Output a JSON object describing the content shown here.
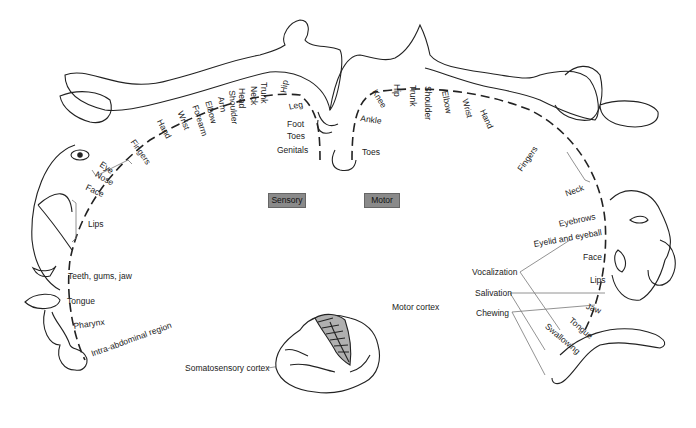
{
  "diagram": {
    "title_labels": {
      "sensory": "Sensory",
      "motor": "Motor"
    },
    "sensory_labels": [
      "Genitals",
      "Toes",
      "Foot",
      "Leg",
      "Hip",
      "Trunk",
      "Neck",
      "Head",
      "Shoulder",
      "Arm",
      "Elbow",
      "Forearm",
      "Wrist",
      "Hand",
      "Fingers",
      "Eye",
      "Nose",
      "Face",
      "Lips",
      "Teeth, gums, jaw",
      "Tongue",
      "Pharynx",
      "Intra-abdominal region"
    ],
    "motor_labels": [
      "Toes",
      "Ankle",
      "Knee",
      "Hip",
      "Trunk",
      "Shoulder",
      "Elbow",
      "Wrist",
      "Hand",
      "Fingers",
      "Neck",
      "Eyebrows",
      "Eyelid and eyeball",
      "Face",
      "Lips",
      "Jaw",
      "Tongue",
      "Swallowing"
    ],
    "function_labels": [
      "Vocalization",
      "Salivation",
      "Chewing"
    ],
    "brain_labels": {
      "motor_cortex": "Motor cortex",
      "somatosensory_cortex": "Somatosensory cortex"
    }
  },
  "colors": {
    "label_box": "#8a8a8a",
    "line": "#222222",
    "leader": "#777777",
    "cortex_fill": "#b0b0b0"
  }
}
